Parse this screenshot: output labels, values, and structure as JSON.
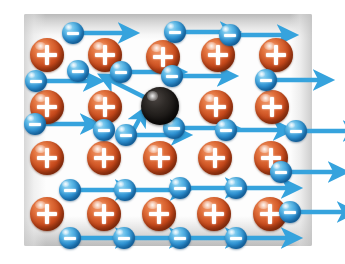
{
  "figure": {
    "title": "Electron drift through a conductor lattice",
    "canvas": {
      "width": 345,
      "height": 264,
      "background": "#ffffff"
    }
  },
  "legend": {
    "positive_label": "+",
    "negative_label": "−",
    "positive_name": "positive ion",
    "negative_name": "free electron",
    "impurity_name": "impurity scattering center",
    "arrow_name": "drift velocity arrow"
  },
  "colors": {
    "positive_ion": "#c94a1c",
    "positive_ion_highlight": "#f3a074",
    "electron": "#2f93d4",
    "electron_highlight": "#a9dcf5",
    "impurity": "#191614",
    "arrow": "#36a3dd",
    "wire_body": "#fdfdfd",
    "wire_shade": "#bdbdbd",
    "glyph": "#ffffff",
    "background": "#ffffff"
  },
  "wire": {
    "x": 24,
    "y": 14,
    "width": 288,
    "height": 232,
    "top_shade_height": 26,
    "bottom_shade_height": 30,
    "edge_shade_width": 22
  },
  "chart_data": {
    "type": "scatter",
    "title": "Electron drift through a conductor lattice",
    "xlabel": "",
    "ylabel": "",
    "xlim": [
      0,
      345
    ],
    "ylim": [
      0,
      264
    ],
    "grid": false,
    "legend_position": "none",
    "series": [
      {
        "name": "positive ions",
        "marker": "sphere-plus",
        "color": "#c94a1c",
        "radius": 17,
        "points": [
          {
            "x": 47,
            "y": 55
          },
          {
            "x": 105,
            "y": 55
          },
          {
            "x": 163,
            "y": 57
          },
          {
            "x": 218,
            "y": 55
          },
          {
            "x": 276,
            "y": 55
          },
          {
            "x": 47,
            "y": 107
          },
          {
            "x": 105,
            "y": 107
          },
          {
            "x": 216,
            "y": 107
          },
          {
            "x": 272,
            "y": 107
          },
          {
            "x": 47,
            "y": 158
          },
          {
            "x": 104,
            "y": 158
          },
          {
            "x": 160,
            "y": 158
          },
          {
            "x": 215,
            "y": 158
          },
          {
            "x": 271,
            "y": 158
          },
          {
            "x": 47,
            "y": 214
          },
          {
            "x": 104,
            "y": 214
          },
          {
            "x": 159,
            "y": 214
          },
          {
            "x": 214,
            "y": 214
          },
          {
            "x": 270,
            "y": 214
          }
        ]
      },
      {
        "name": "free electrons",
        "marker": "sphere-minus",
        "color": "#2f93d4",
        "radius": 11,
        "points": [
          {
            "x": 73,
            "y": 33,
            "arrow_dx": 42,
            "arrow_dy": 0
          },
          {
            "x": 175,
            "y": 32,
            "arrow_dx": 42,
            "arrow_dy": 0
          },
          {
            "x": 230,
            "y": 35,
            "arrow_dx": 44,
            "arrow_dy": 0
          },
          {
            "x": 36,
            "y": 81,
            "arrow_dx": 44,
            "arrow_dy": 0
          },
          {
            "x": 78,
            "y": 71,
            "arrow_dx": 0,
            "arrow_dy": 0
          },
          {
            "x": 121,
            "y": 72,
            "arrow_dx": 42,
            "arrow_dy": 0
          },
          {
            "x": 172,
            "y": 76,
            "arrow_dx": 42,
            "arrow_dy": 0
          },
          {
            "x": 266,
            "y": 80,
            "arrow_dx": 44,
            "arrow_dy": 0
          },
          {
            "x": 35,
            "y": 124,
            "arrow_dx": 42,
            "arrow_dy": 0
          },
          {
            "x": 104,
            "y": 130,
            "arrow_dx": 0,
            "arrow_dy": 0
          },
          {
            "x": 126,
            "y": 135,
            "arrow_dx": 42,
            "arrow_dy": 0
          },
          {
            "x": 174,
            "y": 128,
            "arrow_dx": 42,
            "arrow_dy": 0
          },
          {
            "x": 226,
            "y": 130,
            "arrow_dx": 44,
            "arrow_dy": 0
          },
          {
            "x": 296,
            "y": 131,
            "arrow_dx": 44,
            "arrow_dy": 0
          },
          {
            "x": 281,
            "y": 172,
            "arrow_dx": 44,
            "arrow_dy": 0
          },
          {
            "x": 70,
            "y": 190,
            "arrow_dx": 42,
            "arrow_dy": 0
          },
          {
            "x": 125,
            "y": 190,
            "arrow_dx": 42,
            "arrow_dy": 0
          },
          {
            "x": 180,
            "y": 188,
            "arrow_dx": 42,
            "arrow_dy": 0
          },
          {
            "x": 236,
            "y": 188,
            "arrow_dx": 42,
            "arrow_dy": 0
          },
          {
            "x": 290,
            "y": 212,
            "arrow_dx": 44,
            "arrow_dy": 0
          },
          {
            "x": 70,
            "y": 238,
            "arrow_dx": 42,
            "arrow_dy": 0
          },
          {
            "x": 124,
            "y": 238,
            "arrow_dx": 42,
            "arrow_dy": 0
          },
          {
            "x": 180,
            "y": 238,
            "arrow_dx": 42,
            "arrow_dy": 0
          },
          {
            "x": 236,
            "y": 238,
            "arrow_dx": 42,
            "arrow_dy": 0
          }
        ]
      },
      {
        "name": "impurity",
        "marker": "sphere-dark",
        "color": "#191614",
        "radius": 19,
        "points": [
          {
            "x": 160,
            "y": 106
          }
        ]
      }
    ],
    "annotations": [
      {
        "name": "scatter-in-arrow",
        "from": [
          128,
          140
        ],
        "to": [
          140,
          118
        ],
        "kind": "deflection"
      },
      {
        "name": "scatter-out-arrow",
        "from": [
          146,
          98
        ],
        "to": [
          110,
          80
        ],
        "kind": "deflection"
      }
    ]
  }
}
